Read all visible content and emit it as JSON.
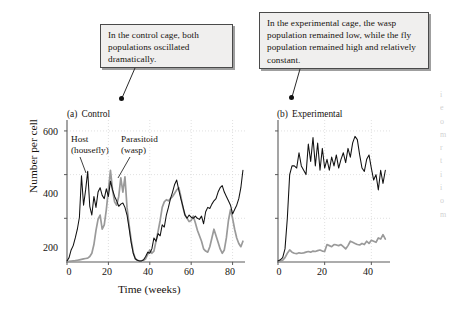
{
  "callouts": {
    "control": {
      "text": "In the control cage, both populations oscillated dramatically."
    },
    "experimental": {
      "text": "In the experimental cage, the wasp population remained low, while the fly population remained high and relatively constant."
    }
  },
  "panel_a": {
    "letter": "(a)",
    "title": "Control",
    "series_labels": {
      "host_line1": "Host",
      "host_line2": "(housefly)",
      "parasitoid_line1": "Parasitoid",
      "parasitoid_line2": "(wasp)"
    },
    "ylabel": "Number per cell",
    "xlabel": "Time (weeks)",
    "yticks": [
      "200",
      "400",
      "600"
    ],
    "xticks": [
      "0",
      "20",
      "40",
      "60",
      "80"
    ]
  },
  "panel_b": {
    "letter": "(b)",
    "title": "Experimental",
    "xticks": [
      "0",
      "20",
      "40"
    ]
  },
  "colors": {
    "host_line": "#111111",
    "parasitoid_line": "#9a9a9a",
    "axis": "#5a5a5a",
    "grid": "#d8d8d8",
    "callout_fill": "#f0efee",
    "callout_border": "#4a4a4a",
    "text": "#17130f"
  },
  "bleed_text": "ieomrtiiom",
  "chart_data": [
    {
      "type": "line",
      "id": "panel-a-control",
      "title": "(a) Control",
      "xlabel": "Time (weeks)",
      "ylabel": "Number per cell",
      "xlim": [
        0,
        86
      ],
      "ylim": [
        0,
        650
      ],
      "xticks": [
        0,
        20,
        40,
        60,
        80
      ],
      "yticks": [
        200,
        400,
        600
      ],
      "grid": true,
      "legend": "inline-labels",
      "series": [
        {
          "name": "Host (housefly)",
          "color": "#111111",
          "x": [
            0,
            1,
            2,
            3,
            4,
            5,
            6,
            7,
            8,
            9,
            10,
            11,
            12,
            13,
            14,
            15,
            16,
            17,
            18,
            19,
            20,
            21,
            22,
            23,
            24,
            25,
            26,
            27,
            28,
            29,
            30,
            31,
            32,
            33,
            34,
            35,
            36,
            37,
            38,
            39,
            40,
            41,
            42,
            43,
            44,
            45,
            46,
            47,
            48,
            49,
            50,
            51,
            52,
            53,
            54,
            55,
            56,
            57,
            58,
            59,
            60,
            61,
            62,
            63,
            64,
            65,
            66,
            67,
            68,
            69,
            70,
            71,
            72,
            73,
            74,
            75,
            76,
            77,
            78,
            79,
            80,
            81,
            82,
            83,
            84,
            85
          ],
          "y": [
            5,
            20,
            55,
            75,
            110,
            150,
            205,
            395,
            260,
            330,
            415,
            255,
            215,
            300,
            250,
            320,
            340,
            305,
            290,
            335,
            300,
            370,
            330,
            300,
            280,
            255,
            265,
            270,
            250,
            215,
            155,
            90,
            40,
            15,
            8,
            5,
            5,
            10,
            25,
            45,
            40,
            60,
            110,
            95,
            130,
            120,
            170,
            160,
            215,
            250,
            290,
            320,
            355,
            375,
            330,
            290,
            255,
            215,
            200,
            215,
            205,
            200,
            210,
            200,
            195,
            210,
            175,
            230,
            250,
            245,
            265,
            280,
            290,
            320,
            340,
            350,
            320,
            300,
            280,
            260,
            220,
            240,
            260,
            290,
            340,
            420
          ]
        },
        {
          "name": "Parasitoid (wasp)",
          "color": "#9a9a9a",
          "x": [
            0,
            1,
            2,
            3,
            4,
            5,
            6,
            7,
            8,
            9,
            10,
            11,
            12,
            13,
            14,
            15,
            16,
            17,
            18,
            19,
            20,
            21,
            22,
            23,
            24,
            25,
            26,
            27,
            28,
            29,
            30,
            31,
            32,
            33,
            34,
            35,
            36,
            37,
            38,
            39,
            40,
            41,
            42,
            43,
            44,
            45,
            46,
            47,
            48,
            49,
            50,
            51,
            52,
            53,
            54,
            55,
            56,
            57,
            58,
            59,
            60,
            61,
            62,
            63,
            64,
            65,
            66,
            67,
            68,
            69,
            70,
            71,
            72,
            73,
            74,
            75,
            76,
            77,
            78,
            79,
            80,
            81,
            82,
            83,
            84,
            85
          ],
          "y": [
            2,
            3,
            4,
            5,
            6,
            8,
            10,
            12,
            14,
            16,
            18,
            25,
            40,
            80,
            145,
            195,
            215,
            150,
            170,
            240,
            330,
            420,
            330,
            275,
            260,
            300,
            385,
            320,
            390,
            250,
            170,
            100,
            45,
            15,
            8,
            5,
            5,
            8,
            15,
            35,
            55,
            40,
            50,
            95,
            140,
            190,
            250,
            275,
            285,
            280,
            290,
            300,
            315,
            330,
            340,
            300,
            250,
            215,
            200,
            185,
            190,
            210,
            180,
            145,
            120,
            95,
            60,
            50,
            45,
            70,
            110,
            150,
            120,
            90,
            60,
            40,
            55,
            110,
            190,
            240,
            200,
            150,
            110,
            85,
            70,
            95
          ]
        }
      ]
    },
    {
      "type": "line",
      "id": "panel-b-experimental",
      "title": "(b) Experimental",
      "xlabel": "",
      "ylabel": "",
      "xlim": [
        0,
        48
      ],
      "ylim": [
        0,
        650
      ],
      "xticks": [
        0,
        20,
        40
      ],
      "yticks": [
        200,
        400,
        600
      ],
      "grid": true,
      "series": [
        {
          "name": "Host (housefly)",
          "color": "#111111",
          "x": [
            0,
            1,
            2,
            3,
            4,
            5,
            6,
            7,
            8,
            9,
            10,
            11,
            12,
            13,
            14,
            15,
            16,
            17,
            18,
            19,
            20,
            21,
            22,
            23,
            24,
            25,
            26,
            27,
            28,
            29,
            30,
            31,
            32,
            33,
            34,
            35,
            36,
            37,
            38,
            39,
            40,
            41,
            42,
            43,
            44,
            45,
            46
          ],
          "y": [
            5,
            10,
            20,
            60,
            200,
            400,
            440,
            440,
            430,
            500,
            440,
            420,
            400,
            540,
            460,
            570,
            440,
            545,
            420,
            520,
            430,
            470,
            420,
            480,
            440,
            490,
            430,
            470,
            500,
            455,
            520,
            480,
            545,
            575,
            560,
            490,
            430,
            415,
            470,
            490,
            430,
            375,
            400,
            330,
            420,
            360,
            420
          ]
        },
        {
          "name": "Parasitoid (wasp)",
          "color": "#9a9a9a",
          "x": [
            0,
            1,
            2,
            3,
            4,
            5,
            6,
            7,
            8,
            9,
            10,
            11,
            12,
            13,
            14,
            15,
            16,
            17,
            18,
            19,
            20,
            21,
            22,
            23,
            24,
            25,
            26,
            27,
            28,
            29,
            30,
            31,
            32,
            33,
            34,
            35,
            36,
            37,
            38,
            39,
            40,
            41,
            42,
            43,
            44,
            45,
            46
          ],
          "y": [
            2,
            4,
            8,
            20,
            40,
            55,
            45,
            40,
            38,
            42,
            40,
            42,
            45,
            48,
            45,
            50,
            48,
            52,
            55,
            50,
            48,
            80,
            75,
            70,
            80,
            78,
            75,
            80,
            70,
            60,
            75,
            95,
            90,
            85,
            80,
            78,
            85,
            80,
            95,
            85,
            100,
            95,
            90,
            110,
            105,
            125,
            105
          ]
        }
      ]
    }
  ]
}
